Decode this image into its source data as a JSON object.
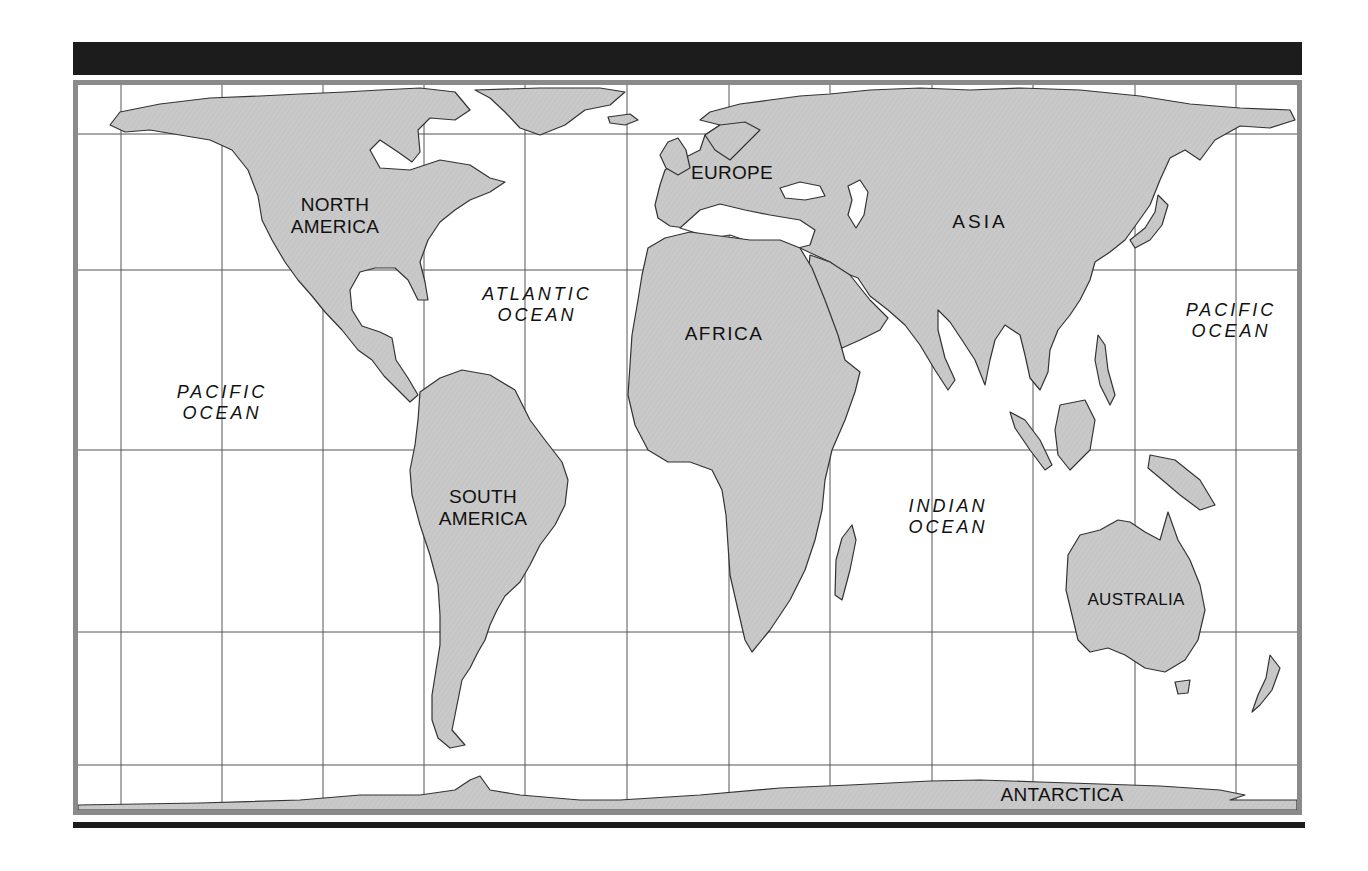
{
  "map": {
    "type": "world-outline-map",
    "colors": {
      "land": "#c8c8c8",
      "coast": "#333333",
      "water": "#ffffff",
      "grid": "#555555",
      "frame": "#8a8a8a",
      "rule": "#1c1c1c"
    },
    "continents": [
      {
        "id": "north-america",
        "line1": "NORTH",
        "line2": "AMERICA",
        "x": 335,
        "y": 216
      },
      {
        "id": "south-america",
        "line1": "SOUTH",
        "line2": "AMERICA",
        "x": 483,
        "y": 508
      },
      {
        "id": "europe",
        "line1": "EUROPE",
        "line2": "",
        "x": 732,
        "y": 173
      },
      {
        "id": "africa",
        "line1": "AFRICA",
        "line2": "",
        "x": 724,
        "y": 334
      },
      {
        "id": "asia",
        "line1": "ASIA",
        "line2": "",
        "x": 980,
        "y": 222
      },
      {
        "id": "australia",
        "line1": "AUSTRALIA",
        "line2": "",
        "x": 1136,
        "y": 600
      },
      {
        "id": "antarctica",
        "line1": "ANTARCTICA",
        "line2": "",
        "x": 1062,
        "y": 795
      }
    ],
    "oceans": [
      {
        "id": "pacific-ocean-west",
        "line1": "PACIFIC",
        "line2": "OCEAN",
        "x": 222,
        "y": 403
      },
      {
        "id": "atlantic-ocean",
        "line1": "ATLANTIC",
        "line2": "OCEAN",
        "x": 537,
        "y": 305
      },
      {
        "id": "indian-ocean",
        "line1": "INDIAN",
        "line2": "OCEAN",
        "x": 948,
        "y": 517
      },
      {
        "id": "pacific-ocean-east",
        "line1": "PACIFIC",
        "line2": "OCEAN",
        "x": 1231,
        "y": 321
      }
    ],
    "grid": {
      "meridians_x": [
        121,
        222,
        323,
        424,
        525,
        627,
        729,
        830,
        932,
        1033,
        1135,
        1236
      ],
      "parallels_y": [
        134,
        270,
        450,
        632,
        765
      ]
    }
  }
}
